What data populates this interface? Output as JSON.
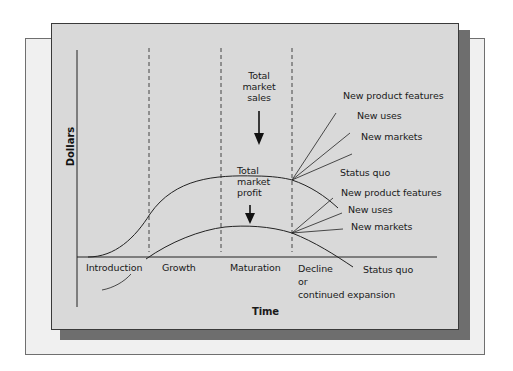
{
  "figure": {
    "y_axis_label": "Dollars",
    "x_axis_label": "Time",
    "stages": [
      {
        "label": "Introduction"
      },
      {
        "label": "Growth"
      },
      {
        "label": "Maturation"
      },
      {
        "label_lines": [
          "Decline",
          "or",
          "continued expansion"
        ]
      }
    ],
    "curves": {
      "sales": {
        "label_lines": [
          "Total",
          "market",
          "sales"
        ],
        "branches": [
          "New product features",
          "New uses",
          "New markets",
          "Status quo"
        ]
      },
      "profit": {
        "label_lines": [
          "Total",
          "market",
          "profit"
        ],
        "branches": [
          "New product features",
          "New uses",
          "New markets",
          "Status quo"
        ]
      }
    },
    "colors": {
      "card_bg": "#d9d9d9",
      "back_card_bg": "#f0f0f0",
      "shadow": "#6e6e6e",
      "line": "#222222"
    }
  }
}
